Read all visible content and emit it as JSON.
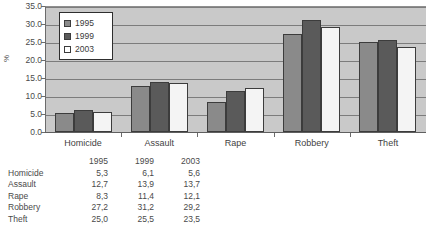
{
  "chart_data": {
    "type": "bar",
    "title": "",
    "xlabel": "",
    "ylabel": "%",
    "ylim": [
      0,
      35
    ],
    "ytick_step": 5,
    "grid": true,
    "legend_position": "top-left-inside",
    "categories": [
      "Homicide",
      "Assault",
      "Rape",
      "Robbery",
      "Theft"
    ],
    "ytick_labels": [
      "35.0",
      "30.0",
      "25.0",
      "20.0",
      "15.0",
      "10.0",
      "5.0",
      "0.0"
    ],
    "series": [
      {
        "name": "1995",
        "color": "#8a8a8a",
        "values": [
          5.3,
          12.7,
          8.3,
          27.2,
          25.0
        ]
      },
      {
        "name": "1999",
        "color": "#5a5a5a",
        "values": [
          6.1,
          13.9,
          11.4,
          31.2,
          25.5
        ]
      },
      {
        "name": "2003",
        "color": "#ffffff",
        "values": [
          5.6,
          13.7,
          12.1,
          29.2,
          23.5
        ]
      }
    ]
  },
  "table": {
    "corner": "",
    "column_headers": [
      "1995",
      "1999",
      "2003"
    ],
    "rows": [
      {
        "label": "Homicide",
        "cells": [
          "5,3",
          "6,1",
          "5,6"
        ]
      },
      {
        "label": "Assault",
        "cells": [
          "12,7",
          "13,9",
          "13,7"
        ]
      },
      {
        "label": "Rape",
        "cells": [
          "8,3",
          "11,4",
          "12,1"
        ]
      },
      {
        "label": "Robbery",
        "cells": [
          "27,2",
          "31,2",
          "29,2"
        ]
      },
      {
        "label": "Theft",
        "cells": [
          "25,0",
          "25,5",
          "23,5"
        ]
      }
    ]
  }
}
